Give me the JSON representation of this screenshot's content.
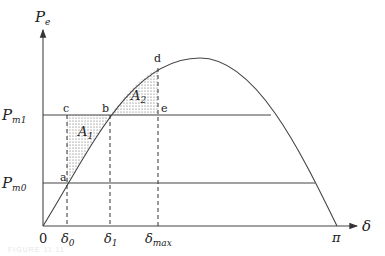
{
  "diagram": {
    "type": "power-angle curve (equal area criterion)",
    "axes": {
      "y_label": "P",
      "y_sub": "e",
      "x_label": "δ"
    },
    "levels": [
      {
        "name": "P",
        "sub": "m1"
      },
      {
        "name": "P",
        "sub": "m0"
      }
    ],
    "x_ticks": [
      {
        "name": "0",
        "sub": ""
      },
      {
        "name": "δ",
        "sub": "0"
      },
      {
        "name": "δ",
        "sub": "1"
      },
      {
        "name": "δ",
        "sub": "max"
      },
      {
        "name": "π",
        "sub": ""
      }
    ],
    "points": [
      "a",
      "b",
      "c",
      "d",
      "e"
    ],
    "areas": [
      {
        "name": "A",
        "sub": "1"
      },
      {
        "name": "A",
        "sub": "2"
      }
    ],
    "caption": "FIGURE 11.11"
  }
}
